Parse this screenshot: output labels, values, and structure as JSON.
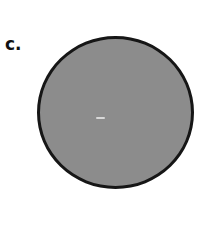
{
  "panel": {
    "label": "c.",
    "shape": "circle",
    "fill_color": "#8c8c8c",
    "stroke_color": "#161616"
  }
}
